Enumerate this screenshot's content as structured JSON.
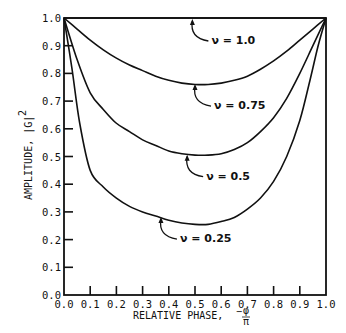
{
  "chart_data": {
    "type": "line",
    "title": "",
    "xlabel": "RELATIVE PHASE, -φ/π",
    "xlabel_main": "RELATIVE PHASE,",
    "xlabel_frac_num": "φ",
    "xlabel_frac_den": "π",
    "xlabel_sign": "−",
    "ylabel": "AMPLITUDE, |G|",
    "ylabel_exp": "2",
    "xlim": [
      0.0,
      1.0
    ],
    "ylim": [
      0.0,
      1.0
    ],
    "x_ticks": [
      "0.0",
      "0.1",
      "0.2",
      "0.3",
      "0.4",
      "0.5",
      "0.6",
      "0.7",
      "0.8",
      "0.9",
      "1.0"
    ],
    "y_ticks": [
      "0.0",
      "0.1",
      "0.2",
      "0.3",
      "0.4",
      "0.5",
      "0.6",
      "0.7",
      "0.8",
      "0.9",
      "1.0"
    ],
    "grid": false,
    "series": [
      {
        "name": "ν = 1.0",
        "label": "ν = 1.0",
        "x": [
          0.0,
          0.1,
          0.2,
          0.3,
          0.4,
          0.5,
          0.6,
          0.7,
          0.8,
          0.9,
          1.0
        ],
        "y": [
          1.0,
          1.0,
          1.0,
          1.0,
          1.0,
          1.0,
          1.0,
          1.0,
          1.0,
          1.0,
          1.0
        ]
      },
      {
        "name": "ν = 0.75",
        "label": "ν = 0.75",
        "x": [
          0.0,
          0.05,
          0.1,
          0.15,
          0.2,
          0.25,
          0.3,
          0.35,
          0.4,
          0.45,
          0.5,
          0.55,
          0.6,
          0.65,
          0.7,
          0.75,
          0.8,
          0.85,
          0.9,
          0.95,
          1.0
        ],
        "y": [
          1.0,
          0.96,
          0.92,
          0.885,
          0.855,
          0.83,
          0.81,
          0.79,
          0.775,
          0.765,
          0.76,
          0.76,
          0.765,
          0.775,
          0.79,
          0.815,
          0.845,
          0.88,
          0.92,
          0.96,
          1.0
        ]
      },
      {
        "name": "ν = 0.5",
        "label": "ν = 0.5",
        "x": [
          0.0,
          0.05,
          0.1,
          0.15,
          0.2,
          0.25,
          0.3,
          0.35,
          0.4,
          0.45,
          0.5,
          0.55,
          0.6,
          0.65,
          0.7,
          0.75,
          0.8,
          0.85,
          0.9,
          0.95,
          1.0
        ],
        "y": [
          1.0,
          0.85,
          0.73,
          0.67,
          0.62,
          0.59,
          0.56,
          0.54,
          0.52,
          0.51,
          0.505,
          0.505,
          0.51,
          0.525,
          0.55,
          0.59,
          0.64,
          0.71,
          0.8,
          0.9,
          1.0
        ]
      },
      {
        "name": "ν = 0.25",
        "label": "ν = 0.25",
        "x": [
          0.0,
          0.03,
          0.06,
          0.1,
          0.15,
          0.2,
          0.25,
          0.3,
          0.35,
          0.4,
          0.45,
          0.5,
          0.55,
          0.6,
          0.65,
          0.7,
          0.75,
          0.8,
          0.85,
          0.9,
          0.94,
          0.97,
          1.0
        ],
        "y": [
          1.0,
          0.82,
          0.62,
          0.45,
          0.39,
          0.35,
          0.32,
          0.3,
          0.285,
          0.27,
          0.26,
          0.255,
          0.255,
          0.265,
          0.28,
          0.31,
          0.35,
          0.41,
          0.5,
          0.63,
          0.78,
          0.9,
          1.0
        ]
      }
    ],
    "annotations": [
      {
        "text": "ν = 1.0",
        "series": 0,
        "points_to_x": 0.49,
        "points_to_y": 1.0
      },
      {
        "text": "ν = 0.75",
        "series": 1,
        "points_to_x": 0.5,
        "points_to_y": 0.765
      },
      {
        "text": "ν = 0.5",
        "series": 2,
        "points_to_x": 0.47,
        "points_to_y": 0.51
      },
      {
        "text": "ν = 0.25",
        "series": 3,
        "points_to_x": 0.37,
        "points_to_y": 0.285
      }
    ]
  }
}
